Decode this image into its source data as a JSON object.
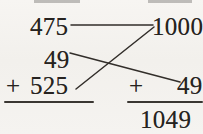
{
  "figure": {
    "kind": "handwritten-arithmetic-matching-diagram",
    "background_color": "#f2f0ec",
    "ink_color": "#262320",
    "crop_note_visible": "partial text row clipped at top edge"
  },
  "left_column": {
    "addend_top": "475",
    "addend_middle": "49",
    "plus_sign": "+",
    "addend_bottom": "525",
    "has_sum_rule": true,
    "sum": ""
  },
  "right_column": {
    "addend_top": "1000",
    "plus_sign": "+",
    "addend_bottom": "49",
    "has_sum_rule": true,
    "sum": "1049"
  },
  "connectors": [
    {
      "name": "connector-475-to-1000",
      "from": "475",
      "to": "1000",
      "style": "horizontal"
    },
    {
      "name": "connector-49-to-49",
      "from": "49",
      "to": "49",
      "style": "diagonal-down"
    },
    {
      "name": "connector-525-to-1000",
      "from": "525",
      "to": "1000",
      "style": "diagonal-up"
    }
  ]
}
